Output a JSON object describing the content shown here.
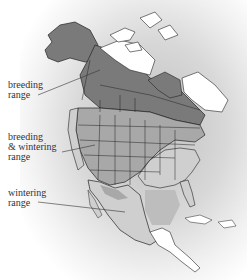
{
  "map": {
    "region": "North America",
    "title_fragment": "",
    "legend": [
      {
        "key": "breeding",
        "label_line1": "breeding",
        "label_line2": "range",
        "color": "#7a7a7a"
      },
      {
        "key": "both",
        "label_line1": "breeding",
        "label_line2": "& wintering",
        "label_line3": "range",
        "color": "#a8a8a8"
      },
      {
        "key": "wintering",
        "label_line1": "wintering",
        "label_line2": "range",
        "color": "#cfcfcf"
      }
    ],
    "colors": {
      "breeding": "#7a7a7a",
      "both": "#a8a8a8",
      "wintering": "#cfcfcf",
      "none": "#ffffff",
      "border": "#222222"
    }
  }
}
